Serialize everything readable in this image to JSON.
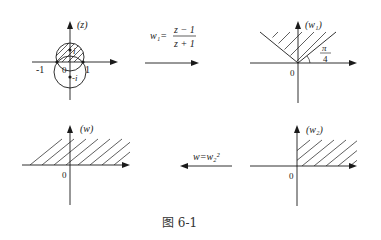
{
  "figure": {
    "caption": "图 6-1",
    "panels": {
      "z_plane": {
        "label": "(z)",
        "tick_neg_one": "-1",
        "tick_one": "1",
        "origin": "0",
        "point_i": "i",
        "point_neg_i": "-i"
      },
      "w1_plane": {
        "label": "(w₁)",
        "origin": "0",
        "angle_num": "π",
        "angle_den": "4"
      },
      "w_plane": {
        "label": "(w)",
        "origin": "0"
      },
      "w2_plane": {
        "label": "(w₂)",
        "origin": "0"
      }
    },
    "maps": {
      "map1_lhs": "w₁=",
      "map1_num": "z − 1",
      "map1_den": "z + 1",
      "map2": "w=w₂²"
    }
  },
  "colors": {
    "ink": "#1a1a1a",
    "background": "#ffffff"
  }
}
